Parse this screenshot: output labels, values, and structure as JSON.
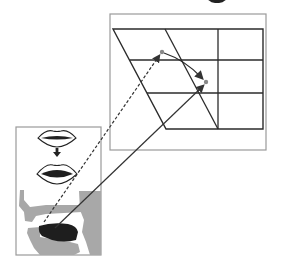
{
  "figure": {
    "title_fragment": "",
    "colors": {
      "background": "#ffffff",
      "frame": "#9a9a9a",
      "grid_line": "#2b2b2b",
      "tissue_gray": "#a8a8a8",
      "tongue": "#1e1e1e",
      "point": "#888888",
      "arrow": "#333333"
    },
    "vowel_chart_panel": {
      "frame": {
        "x": 110,
        "y": 14,
        "w": 156,
        "h": 136
      },
      "quadrilateral": {
        "top_left": [
          113,
          29
        ],
        "top_right": [
          263,
          29
        ],
        "bottom_right": [
          263,
          129
        ],
        "bottom_left": [
          166,
          129
        ]
      },
      "inner_slanted_line": {
        "top": [
          165,
          29
        ],
        "bottom": [
          218,
          129
        ]
      },
      "vertical_line_x": 218,
      "horizontal_lines_y": [
        60,
        93
      ],
      "points": [
        {
          "id": "start",
          "x": 162,
          "y": 52
        },
        {
          "id": "end",
          "x": 206,
          "y": 82
        }
      ],
      "trajectory_label": "diphthong trajectory"
    },
    "articulation_panel": {
      "frame": {
        "x": 16,
        "y": 127,
        "w": 85,
        "h": 128
      },
      "lips_closed": {
        "cx": 57,
        "cy": 138
      },
      "transition_arrow": "down-arrow",
      "lips_open": {
        "cx": 57,
        "cy": 174
      },
      "vocal_tract": "midsagittal-section"
    },
    "mapping_lines": [
      {
        "style": "dashed",
        "from": [
          44,
          222
        ],
        "to": [
          159,
          56
        ]
      },
      {
        "style": "solid",
        "from": [
          55,
          228
        ],
        "to": [
          204,
          85
        ]
      }
    ]
  }
}
